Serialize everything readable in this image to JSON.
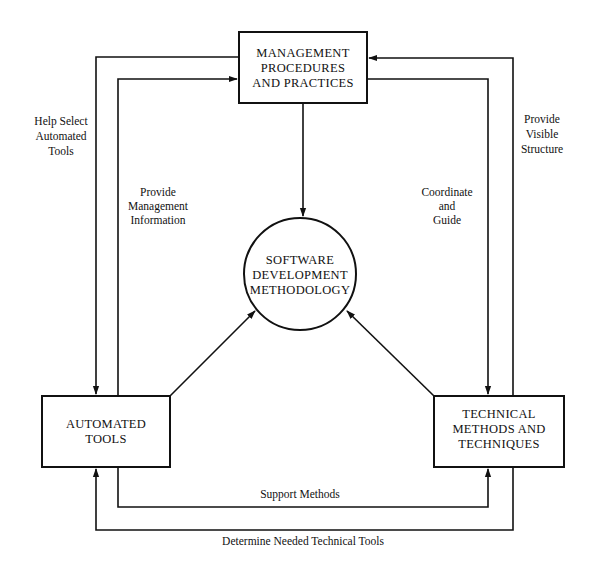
{
  "diagram": {
    "nodes": {
      "management": {
        "lines": [
          "MANAGEMENT",
          "PROCEDURES",
          "AND PRACTICES"
        ],
        "shape": "rectangle"
      },
      "methodology": {
        "lines": [
          "SOFTWARE",
          "DEVELOPMENT",
          "METHODOLOGY"
        ],
        "shape": "circle"
      },
      "automated_tools": {
        "lines": [
          "AUTOMATED",
          "TOOLS"
        ],
        "shape": "rectangle"
      },
      "technical": {
        "lines": [
          "TECHNICAL",
          "METHODS AND",
          "TECHNIQUES"
        ],
        "shape": "rectangle"
      }
    },
    "edges": {
      "help_select": {
        "from": "management",
        "to": "automated_tools",
        "lines": [
          "Help Select",
          "Automated",
          "Tools"
        ]
      },
      "provide_mgmt_info": {
        "from": "automated_tools",
        "to": "management",
        "lines": [
          "Provide",
          "Management",
          "Information"
        ]
      },
      "coordinate_guide": {
        "from": "management",
        "to": "technical",
        "lines": [
          "Coordinate",
          "and",
          "Guide"
        ]
      },
      "provide_visible": {
        "from": "technical",
        "to": "management",
        "lines": [
          "Provide",
          "Visible",
          "Structure"
        ]
      },
      "support_methods": {
        "from": "automated_tools",
        "to": "technical",
        "label": "Support Methods"
      },
      "determine_tools": {
        "from": "technical",
        "to": "automated_tools",
        "label": "Determine Needed Technical Tools"
      },
      "mgmt_to_method": {
        "from": "management",
        "to": "methodology"
      },
      "tools_to_method": {
        "from": "automated_tools",
        "to": "methodology"
      },
      "tech_to_method": {
        "from": "technical",
        "to": "methodology"
      }
    },
    "colors": {
      "stroke": "#111111",
      "background": "#ffffff"
    }
  }
}
